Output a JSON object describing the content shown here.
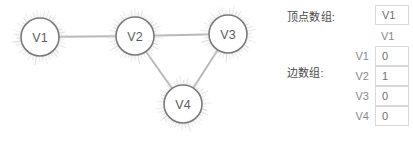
{
  "graph": {
    "nodes": [
      {
        "id": "v1",
        "label": "V1",
        "cx": 40,
        "cy": 37,
        "r": 19
      },
      {
        "id": "v2",
        "label": "V2",
        "cx": 135,
        "cy": 36,
        "r": 19
      },
      {
        "id": "v3",
        "label": "V3",
        "cx": 228,
        "cy": 34,
        "r": 19
      },
      {
        "id": "v4",
        "label": "V4",
        "cx": 183,
        "cy": 104,
        "r": 19
      }
    ],
    "edges": [
      {
        "from": "v1",
        "to": "v2"
      },
      {
        "from": "v2",
        "to": "v3"
      },
      {
        "from": "v2",
        "to": "v4"
      },
      {
        "from": "v3",
        "to": "v4"
      }
    ],
    "colors": {
      "node_stroke": "#7a7a7a",
      "node_fill": "#ffffff",
      "node_text": "#5c5c5c",
      "edge": "#b9b9b9",
      "glow": "#c9c9c9"
    }
  },
  "form": {
    "vertex_array_label": "顶点数组:",
    "edge_array_label": "边数组:",
    "vertex_array_value": "V1",
    "matrix": {
      "column_headers": [
        "V1"
      ],
      "row_headers": [
        "V1",
        "V2",
        "V3",
        "V4"
      ],
      "rows": [
        [
          "0"
        ],
        [
          "1"
        ],
        [
          "0"
        ],
        [
          "0"
        ]
      ]
    }
  }
}
